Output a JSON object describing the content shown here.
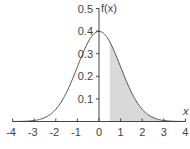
{
  "chart_data": {
    "type": "area",
    "title": "",
    "xlabel": "x",
    "ylabel": "f(x)",
    "xlim": [
      -4,
      4
    ],
    "ylim": [
      0,
      0.5
    ],
    "x_ticks": [
      -4,
      -3,
      -2,
      -1,
      0,
      1,
      2,
      3,
      4
    ],
    "x_tick_labels": [
      "-4",
      "-3",
      "-2",
      "-1",
      "0",
      "1",
      "2",
      "3",
      "4"
    ],
    "y_ticks": [
      0.1,
      0.2,
      0.3,
      0.4,
      0.5
    ],
    "y_tick_labels": [
      "0.1",
      "0.2",
      "0.3",
      "0.4",
      "0.5"
    ],
    "grid": false,
    "legend": null,
    "series": [
      {
        "name": "f(x)",
        "function": "standard normal pdf",
        "mean": 0,
        "sd": 1,
        "x": [
          -4,
          -3.5,
          -3,
          -2.5,
          -2,
          -1.5,
          -1,
          -0.5,
          0,
          0.5,
          1,
          1.5,
          2,
          2.5,
          3,
          3.5,
          4
        ],
        "y": [
          0.0001,
          0.0009,
          0.0044,
          0.0175,
          0.054,
          0.1295,
          0.242,
          0.3521,
          0.3989,
          0.3521,
          0.242,
          0.1295,
          0.054,
          0.0175,
          0.0044,
          0.0009,
          0.0001
        ]
      }
    ],
    "shaded_region": {
      "from": 0.5,
      "to": 4,
      "color": "#d9d9d9"
    },
    "colors": {
      "curve": "#555555",
      "axis": "#444444",
      "shade": "#d9d9d9"
    }
  }
}
